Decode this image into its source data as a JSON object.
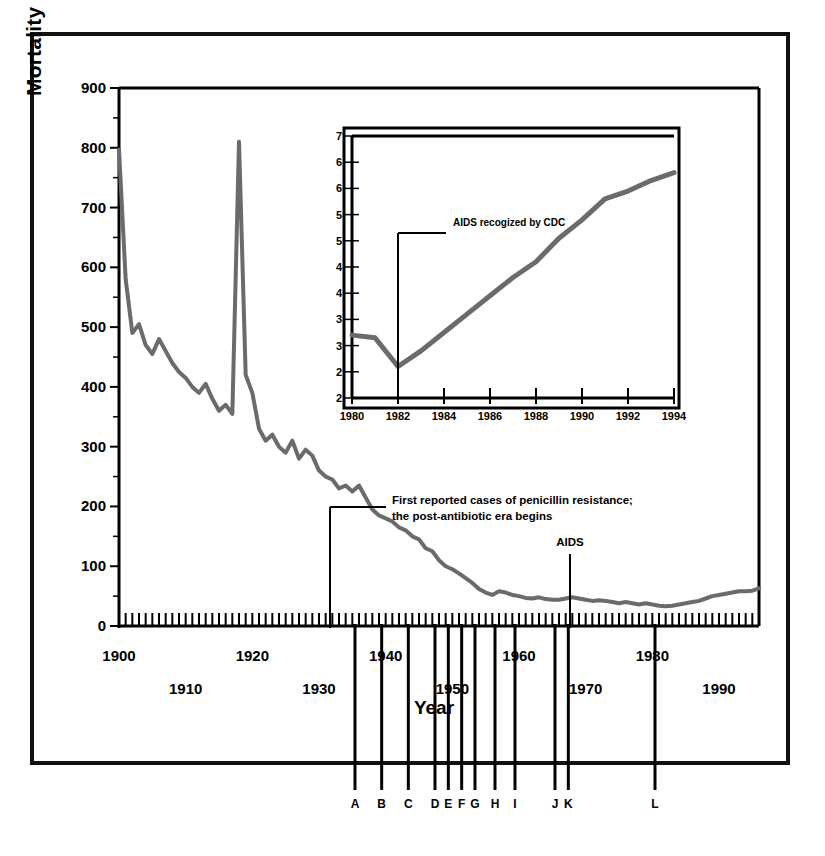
{
  "figure": {
    "y_axis_title": "Mortality Rates per 100,000 US population",
    "x_axis_title": "Year"
  },
  "chart_data": {
    "type": "line",
    "title": "",
    "xlabel": "Year",
    "ylabel": "Mortality Rates per 100,000 US population",
    "xlim": [
      1900,
      1996
    ],
    "ylim": [
      0,
      900
    ],
    "grid": false,
    "legend": "none",
    "y_ticks": [
      0,
      100,
      200,
      300,
      400,
      500,
      600,
      700,
      800,
      900
    ],
    "y_minor_ticks": [
      50,
      150,
      250,
      350,
      450,
      550,
      650,
      750,
      850
    ],
    "x_ticks": [
      1900,
      1910,
      1920,
      1930,
      1940,
      1950,
      1960,
      1970,
      1980,
      1990
    ],
    "series": [
      {
        "name": "Infectious disease mortality rate",
        "x": [
          1900,
          1901,
          1902,
          1903,
          1904,
          1905,
          1906,
          1907,
          1908,
          1909,
          1910,
          1911,
          1912,
          1913,
          1914,
          1915,
          1916,
          1917,
          1918,
          1919,
          1920,
          1921,
          1922,
          1923,
          1924,
          1925,
          1926,
          1927,
          1928,
          1929,
          1930,
          1931,
          1932,
          1933,
          1934,
          1935,
          1936,
          1937,
          1938,
          1939,
          1940,
          1941,
          1942,
          1943,
          1944,
          1945,
          1946,
          1947,
          1948,
          1949,
          1950,
          1951,
          1952,
          1953,
          1954,
          1955,
          1956,
          1957,
          1958,
          1959,
          1960,
          1961,
          1962,
          1963,
          1964,
          1965,
          1966,
          1967,
          1968,
          1969,
          1970,
          1971,
          1972,
          1973,
          1974,
          1975,
          1976,
          1977,
          1978,
          1979,
          1980,
          1981,
          1982,
          1983,
          1984,
          1985,
          1986,
          1987,
          1988,
          1989,
          1990,
          1991,
          1992,
          1993,
          1994,
          1995,
          1996
        ],
        "values": [
          797,
          580,
          490,
          505,
          470,
          455,
          480,
          460,
          440,
          425,
          415,
          400,
          390,
          405,
          380,
          360,
          370,
          355,
          810,
          420,
          390,
          330,
          310,
          320,
          300,
          290,
          310,
          280,
          295,
          285,
          260,
          250,
          245,
          230,
          235,
          225,
          235,
          215,
          195,
          185,
          180,
          175,
          165,
          160,
          150,
          145,
          130,
          125,
          110,
          100,
          95,
          88,
          80,
          72,
          62,
          56,
          52,
          58,
          56,
          52,
          50,
          47,
          46,
          48,
          45,
          44,
          44,
          46,
          48,
          46,
          44,
          42,
          43,
          42,
          40,
          38,
          40,
          38,
          36,
          38,
          36,
          34,
          33,
          34,
          36,
          38,
          40,
          42,
          46,
          50,
          52,
          54,
          56,
          58,
          58,
          59,
          63
        ]
      }
    ],
    "events": [
      {
        "label": "First reported cases of penicillin resistance; the post-antibiotic era begins",
        "year": 1945
      },
      {
        "label": "AIDS",
        "year": 1981
      }
    ],
    "markers": [
      {
        "letter": "A",
        "year": 1936
      },
      {
        "letter": "B",
        "year": 1940
      },
      {
        "letter": "C",
        "year": 1944
      },
      {
        "letter": "D",
        "year": 1948
      },
      {
        "letter": "E",
        "year": 1950
      },
      {
        "letter": "F",
        "year": 1952
      },
      {
        "letter": "G",
        "year": 1954
      },
      {
        "letter": "H",
        "year": 1957
      },
      {
        "letter": "I",
        "year": 1960
      },
      {
        "letter": "J",
        "year": 1966
      },
      {
        "letter": "K",
        "year": 1968
      },
      {
        "letter": "L",
        "year": 1981
      }
    ],
    "inset": {
      "type": "line",
      "xlim": [
        1980,
        1994
      ],
      "ylim": [
        2.0,
        7.0
      ],
      "x_ticks": [
        1980,
        1982,
        1984,
        1986,
        1988,
        1990,
        1992,
        1994
      ],
      "y_ticks": [
        2.0,
        2.5,
        3.0,
        3.5,
        4.0,
        4.5,
        5.0,
        5.5,
        6.0,
        6.5,
        7.0
      ],
      "y_tick_labels": [
        "2",
        "2",
        "3",
        "3",
        "4",
        "4",
        "5",
        "5",
        "6",
        "6",
        "7"
      ],
      "annotation": "AIDS recogized by CDC",
      "annotation_year": 1982,
      "series": [
        {
          "name": "Infectious disease mortality rate (1980-1994)",
          "x": [
            1980,
            1981,
            1982,
            1983,
            1984,
            1985,
            1986,
            1987,
            1988,
            1989,
            1990,
            1991,
            1992,
            1993,
            1994
          ],
          "values": [
            3.2,
            3.15,
            2.6,
            2.9,
            3.25,
            3.6,
            3.95,
            4.3,
            4.6,
            5.05,
            5.4,
            5.8,
            5.95,
            6.15,
            6.3
          ]
        }
      ]
    }
  }
}
